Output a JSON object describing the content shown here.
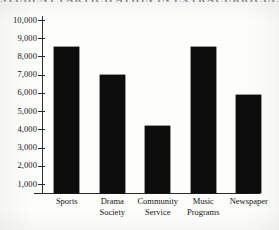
{
  "chart_data": {
    "type": "bar",
    "title": "STUDENT PARTICIPATION IN EXTRACURRICULAR ORGANIZATIONS",
    "xlabel": "",
    "ylabel": "",
    "categories": [
      "Sports",
      "Drama Society",
      "Community Service",
      "Music Programs",
      "Newspaper"
    ],
    "values": [
      8500,
      7000,
      4200,
      8500,
      5900
    ],
    "ylim": [
      0,
      10000
    ],
    "ytick_labels": [
      "10,000",
      "9,000",
      "8,000",
      "7,000",
      "6,000",
      "5,000",
      "4,000",
      "3,000",
      "2,000",
      "1,000"
    ],
    "ytick_values": [
      10000,
      9000,
      8000,
      7000,
      6000,
      5000,
      4000,
      3000,
      2000,
      1000
    ],
    "grid": false,
    "legend": null,
    "bar_color": "#0d0d0d",
    "axis_color": "#2a2a2a",
    "background_color": "#fdfdfc"
  },
  "axis": {
    "category_lines": [
      [
        "Sports"
      ],
      [
        "Drama",
        "Society"
      ],
      [
        "Community",
        "Service"
      ],
      [
        "Music",
        "Programs"
      ],
      [
        "Newspaper"
      ]
    ]
  }
}
